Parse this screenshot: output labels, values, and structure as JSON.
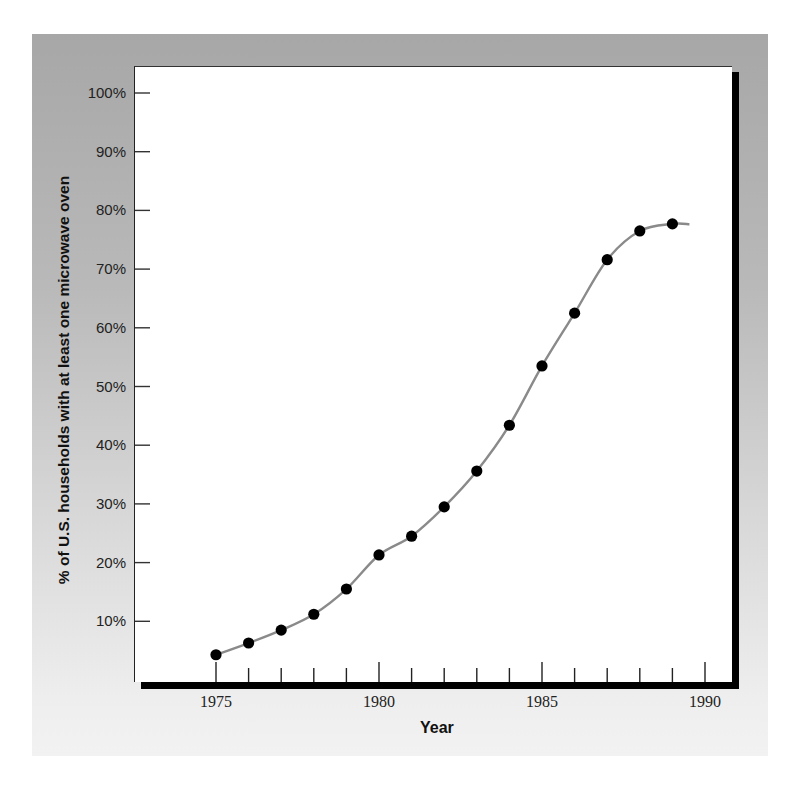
{
  "chart_data": {
    "type": "line",
    "title": "",
    "xlabel": "Year",
    "ylabel": "% of U.S. households with at least one microwave oven",
    "x": [
      1975,
      1976,
      1977,
      1978,
      1979,
      1980,
      1981,
      1982,
      1983,
      1984,
      1985,
      1986,
      1987,
      1988,
      1989
    ],
    "series": [
      {
        "name": "Microwave oven ownership",
        "values": [
          4.3,
          6.3,
          8.5,
          11.2,
          15.5,
          21.3,
          24.5,
          29.5,
          35.6,
          43.4,
          53.5,
          62.5,
          71.6,
          76.5,
          77.7
        ],
        "marker": "filled-circle",
        "line": "smooth"
      }
    ],
    "xlim": [
      1972.5,
      1991
    ],
    "ylim": [
      0,
      105
    ],
    "x_ticks_major": [
      1975,
      1980,
      1985,
      1990
    ],
    "x_tick_labels": [
      "1975",
      "1980",
      "1985",
      "1990"
    ],
    "x_ticks_minor_step": 1,
    "y_ticks": [
      10,
      20,
      30,
      40,
      50,
      60,
      70,
      80,
      90,
      100
    ],
    "y_tick_labels": [
      "10%",
      "20%",
      "30%",
      "40%",
      "50%",
      "60%",
      "70%",
      "80%",
      "90%",
      "100%"
    ],
    "grid": false,
    "legend": null,
    "colors": {
      "line": "#8a8a8a",
      "marker": "#000000",
      "panel_top": "#a7a7a7",
      "panel_bottom": "#f2f2f2",
      "plot_bg": "#ffffff"
    }
  },
  "labels": {
    "xlabel": "Year",
    "ylabel": "% of U.S. households with at least one microwave oven"
  }
}
